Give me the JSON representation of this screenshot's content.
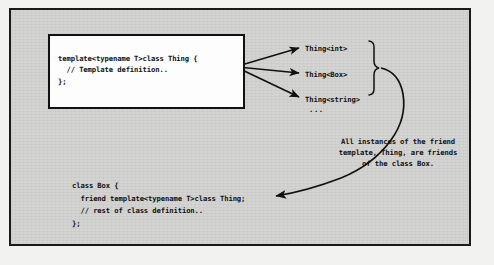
{
  "figure": {
    "background_color": "#d2d2d0",
    "border_color": "#1b1b1b",
    "page_color": "#f2f2f0"
  },
  "template_box": {
    "name": "template-definition-box",
    "background_color": "#fdfdfd",
    "code": "template<typename T>class Thing {\n  // Template definition..\n};"
  },
  "instances": {
    "heading": "",
    "items": [
      {
        "label": "Thing<int>"
      },
      {
        "label": "Thing<Box>"
      },
      {
        "label": "Thing<string>"
      },
      {
        "label": "..."
      }
    ]
  },
  "annotation": {
    "line1": "All instances of the friend",
    "line2": "template, Thing, are friends",
    "line3": "of the class Box."
  },
  "box_code": {
    "name": "class-box-code",
    "code": "class Box {\n  friend template<typename T>class Thing;\n  // rest of class definition..\n};"
  },
  "connectors": {
    "instantiation_arrows": 3,
    "brace_label": "grouping-brace",
    "friend_arrow": "curved-arrow-to-friend-declaration"
  }
}
